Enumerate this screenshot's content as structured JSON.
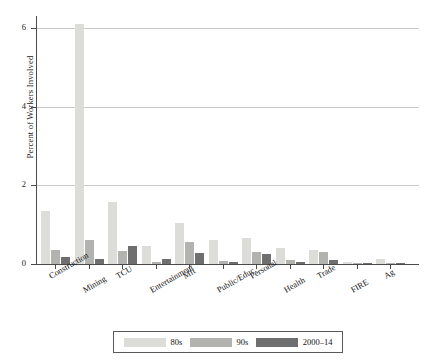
{
  "chart_data": {
    "type": "bar",
    "title": "",
    "xlabel": "",
    "ylabel": "Percent of Workers Involved",
    "ylim": [
      0,
      6.3
    ],
    "yticks": [
      0,
      2,
      4,
      6
    ],
    "ytick_labels": [
      "0",
      "2",
      "4",
      "6"
    ],
    "grid": true,
    "legend_position": "bottom",
    "categories": [
      "Construction",
      "Mining",
      "TCU",
      "Entertainment",
      "Mft",
      "Public/Educ.",
      "Personal",
      "Health",
      "Trade",
      "FIRE",
      "Ag"
    ],
    "series": [
      {
        "name": "80s",
        "color": "#dcdcd8",
        "values": [
          1.35,
          6.1,
          1.58,
          0.45,
          1.05,
          0.6,
          0.65,
          0.4,
          0.35,
          0.05,
          0.12
        ]
      },
      {
        "name": "90s",
        "color": "#b2b2ae",
        "values": [
          0.35,
          0.6,
          0.32,
          0.04,
          0.55,
          0.08,
          0.3,
          0.1,
          0.3,
          0.02,
          0.02
        ]
      },
      {
        "name": "2000-14",
        "color": "#6f6f6f",
        "values": [
          0.18,
          0.14,
          0.45,
          0.12,
          0.28,
          0.05,
          0.25,
          0.04,
          0.1,
          0.01,
          0.01
        ]
      }
    ]
  },
  "legend": {
    "items": [
      {
        "label": "80s"
      },
      {
        "label": "90s"
      },
      {
        "label": "2000–14"
      }
    ]
  }
}
